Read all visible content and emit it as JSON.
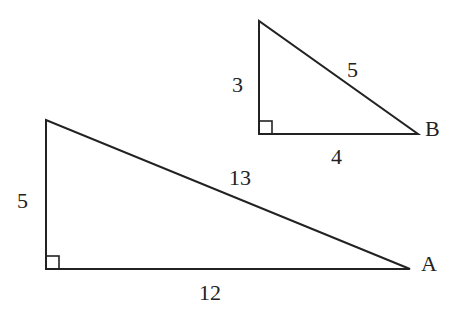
{
  "triangles": [
    {
      "name": "B",
      "vertex_label": "B",
      "legs": [
        "3",
        "4"
      ],
      "hypotenuse": "5",
      "side_labels": {
        "vertical": "3",
        "horizontal": "4",
        "hypotenuse": "5"
      }
    },
    {
      "name": "A",
      "vertex_label": "A",
      "legs": [
        "5",
        "12"
      ],
      "hypotenuse": "13",
      "side_labels": {
        "vertical": "5",
        "horizontal": "12",
        "hypotenuse": "13"
      }
    }
  ]
}
